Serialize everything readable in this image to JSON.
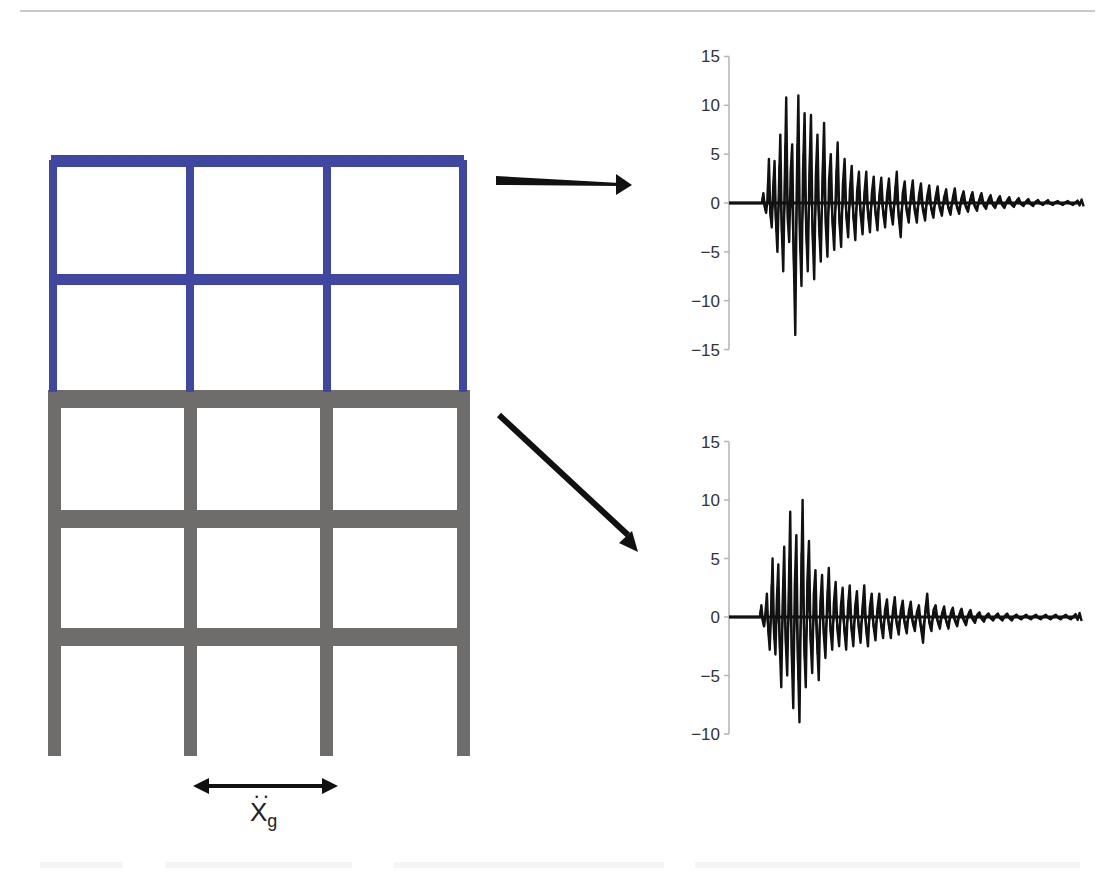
{
  "figure": {
    "frame": {
      "colors": {
        "upper_stories": "#3f47a0",
        "lower_stories": "#6f6c6c"
      },
      "bays": 3,
      "upper_floors": 2,
      "lower_floors": 3
    },
    "ground_motion_label": {
      "base": "X",
      "subscript": "g",
      "accent": "double-dot (acceleration)"
    },
    "arrows": [
      {
        "name": "arrow-to-top-chart",
        "direction": "right"
      },
      {
        "name": "arrow-to-bottom-chart",
        "direction": "down-right"
      }
    ],
    "ground_arrow": {
      "direction": "bidirectional-horizontal"
    }
  },
  "chart_data": [
    {
      "type": "line",
      "title": "",
      "xlabel": "",
      "ylabel": "",
      "ylim": [
        -15,
        15
      ],
      "yticks": [
        15,
        10,
        5,
        0,
        -5,
        -10,
        -15
      ],
      "ytick_labels": [
        "15",
        "10",
        "5",
        "0",
        "−5",
        "−10",
        "−15"
      ],
      "grid": false,
      "description": "Acceleration response of upper (blue) structure - decaying oscillation",
      "envelope_peaks": {
        "positive": [
          1,
          4.5,
          4.3,
          7,
          10.8,
          6,
          11,
          9.2,
          9,
          7,
          8.2,
          5,
          6.2,
          4.5,
          3.8,
          3.2,
          3.2,
          2.7,
          2.6,
          2.5,
          3.2,
          2.2,
          2.3,
          2,
          1.8,
          1.7,
          1.4,
          1.5,
          1.2,
          1.1,
          1,
          0.8,
          0.7,
          0.6,
          0.5,
          0.4,
          0.3,
          0.3,
          0.2,
          0.2
        ],
        "negative": [
          -1,
          -2.5,
          -5,
          -7,
          -4,
          -13.5,
          -8.5,
          -7,
          -7.8,
          -6,
          -5.5,
          -4.8,
          -4.5,
          -3.5,
          -3.8,
          -3.2,
          -3.0,
          -2.8,
          -2.5,
          -2.2,
          -3.5,
          -2.0,
          -2.0,
          -1.8,
          -1.5,
          -1.3,
          -1.2,
          -1.1,
          -0.9,
          -0.8,
          -0.6,
          -0.5,
          -0.5,
          -0.4,
          -0.3,
          -0.3,
          -0.2,
          -0.2,
          -0.2,
          -0.2
        ]
      }
    },
    {
      "type": "line",
      "title": "",
      "xlabel": "",
      "ylabel": "",
      "ylim": [
        -10,
        15
      ],
      "yticks": [
        15,
        10,
        5,
        0,
        -5,
        -10
      ],
      "ytick_labels": [
        "15",
        "10",
        "5",
        "0",
        "−5",
        "−10"
      ],
      "grid": false,
      "description": "Acceleration response of lower (grey) structure - decaying oscillation",
      "envelope_peaks": {
        "positive": [
          1,
          2,
          5,
          4.5,
          6,
          9,
          7,
          10,
          6.5,
          4,
          3.6,
          4.2,
          3,
          2.5,
          2.7,
          2.2,
          2.7,
          2,
          2,
          1.5,
          1.7,
          1.4,
          1.3,
          1.0,
          2.0,
          1.0,
          0.9,
          0.8,
          0.7,
          0.6,
          0.4,
          0.3,
          0.3,
          0.3,
          0.2,
          0.2,
          0.2,
          0.2,
          0.2,
          0.2
        ],
        "negative": [
          -0.8,
          -2.8,
          -3.2,
          -6,
          -5,
          -7.8,
          -9,
          -6,
          -4.8,
          -5.4,
          -3.5,
          -2.8,
          -2.5,
          -2.8,
          -2.5,
          -2.2,
          -2.5,
          -2.0,
          -1.8,
          -1.8,
          -1.5,
          -1.4,
          -1.2,
          -2.2,
          -1.2,
          -1.0,
          -1.0,
          -0.8,
          -0.7,
          -0.5,
          -0.4,
          -0.3,
          -0.3,
          -0.3,
          -0.2,
          -0.2,
          -0.2,
          -0.2,
          -0.2,
          -0.2
        ]
      }
    }
  ]
}
